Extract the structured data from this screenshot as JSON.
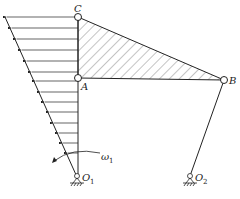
{
  "diagram": {
    "type": "four-bar-linkage-velocity-distribution",
    "colors": {
      "line": "#222222",
      "hatch": "#555555",
      "background": "#ffffff"
    },
    "points": {
      "C": {
        "label": "C",
        "x": 78,
        "y": 17
      },
      "A": {
        "label": "A",
        "x": 78,
        "y": 78
      },
      "B": {
        "label": "B",
        "x": 224,
        "y": 80
      },
      "O1": {
        "label": "O",
        "sub": "1",
        "x": 77,
        "y": 178
      },
      "O2": {
        "label": "O",
        "sub": "2",
        "x": 190,
        "y": 178
      }
    },
    "labels": {
      "C": "C",
      "A": "A",
      "B": "B",
      "O1_main": "O",
      "O1_sub": "1",
      "O2_main": "O",
      "O2_sub": "2",
      "omega_main": "ω",
      "omega_sub": "1"
    },
    "velocity_profile": {
      "top_left": {
        "x": 5,
        "y": 17
      },
      "arrow_rows_y": [
        17,
        28,
        39,
        50,
        61,
        72,
        80,
        92,
        102,
        112,
        123,
        133,
        143,
        153
      ],
      "arrow_count": 14
    },
    "hatched_triangle": [
      "C",
      "A",
      "B"
    ],
    "rotation": {
      "symbol": "ω1",
      "direction": "counterclockwise"
    }
  }
}
